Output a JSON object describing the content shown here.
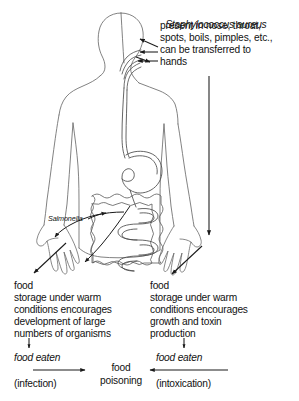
{
  "figure": {
    "background_color": "#ffffff",
    "ink_color": "#1a1a1a",
    "body_outline_color": "#555555"
  },
  "callout": {
    "organism": "Staphylococcus aureus",
    "line1": "present in nose, throat,",
    "line2": "spots, boils, pimples, etc.,",
    "line3": "can be transferred to",
    "line4": "hands"
  },
  "anatomy": {
    "organism_label": "Salmonella",
    "parts": [
      "head",
      "nasal-passage",
      "throat",
      "oesophagus",
      "stomach",
      "large-intestine",
      "small-intestine",
      "left-hand",
      "right-hand"
    ]
  },
  "left_pathway": {
    "lead": "food",
    "lines": [
      "storage under warm",
      "conditions encourages",
      "development of large",
      "numbers of organisms"
    ],
    "eaten": "food eaten",
    "mechanism": "(infection)"
  },
  "right_pathway": {
    "lead": "food",
    "lines": [
      "storage under warm",
      "conditions encourages",
      "growth and toxin",
      "production"
    ],
    "eaten": "food eaten",
    "mechanism": "(intoxication)"
  },
  "outcome": {
    "line1": "food",
    "line2": "poisoning"
  }
}
